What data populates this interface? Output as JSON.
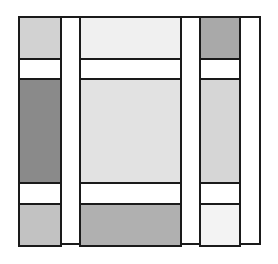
{
  "diagram": {
    "title": "",
    "frame": {
      "x": 18,
      "y": 16,
      "w": 241,
      "h": 229,
      "border": "#1a1a1a"
    },
    "columns_x": [
      18,
      60,
      79,
      180,
      199,
      239,
      259
    ],
    "rows_y": [
      16,
      58,
      78,
      182,
      203,
      245
    ],
    "cells": [
      {
        "id": "r1c1",
        "x": 18,
        "y": 16,
        "w": 42,
        "h": 42,
        "fill": "#d2d2d2"
      },
      {
        "id": "r1c3",
        "x": 79,
        "y": 16,
        "w": 101,
        "h": 42,
        "fill": "#f0f0f0"
      },
      {
        "id": "r1c5",
        "x": 199,
        "y": 16,
        "w": 40,
        "h": 42,
        "fill": "#a9a9a9"
      },
      {
        "id": "r2c1",
        "x": 18,
        "y": 58,
        "w": 42,
        "h": 20,
        "fill": "#ffffff"
      },
      {
        "id": "r2c3",
        "x": 79,
        "y": 58,
        "w": 101,
        "h": 20,
        "fill": "#ffffff"
      },
      {
        "id": "r2c5",
        "x": 199,
        "y": 58,
        "w": 40,
        "h": 20,
        "fill": "#ffffff"
      },
      {
        "id": "r3c1",
        "x": 18,
        "y": 78,
        "w": 42,
        "h": 104,
        "fill": "#8a8a8a"
      },
      {
        "id": "r3c3",
        "x": 79,
        "y": 78,
        "w": 101,
        "h": 104,
        "fill": "#e2e2e2"
      },
      {
        "id": "r3c5",
        "x": 199,
        "y": 78,
        "w": 40,
        "h": 104,
        "fill": "#d6d6d6"
      },
      {
        "id": "r4c1",
        "x": 18,
        "y": 182,
        "w": 42,
        "h": 21,
        "fill": "#ffffff"
      },
      {
        "id": "r4c3",
        "x": 79,
        "y": 182,
        "w": 101,
        "h": 21,
        "fill": "#ffffff"
      },
      {
        "id": "r4c5",
        "x": 199,
        "y": 182,
        "w": 40,
        "h": 21,
        "fill": "#ffffff"
      },
      {
        "id": "r5c1",
        "x": 18,
        "y": 203,
        "w": 42,
        "h": 42,
        "fill": "#c2c2c2"
      },
      {
        "id": "r5c3",
        "x": 79,
        "y": 203,
        "w": 101,
        "h": 42,
        "fill": "#b0b0b0"
      },
      {
        "id": "r5c5",
        "x": 199,
        "y": 203,
        "w": 40,
        "h": 42,
        "fill": "#f3f3f3"
      }
    ],
    "vertical_strips": [
      {
        "id": "strip-a",
        "x": 60,
        "y": 16,
        "w": 19,
        "h": 229,
        "fill": "#ffffff"
      },
      {
        "id": "strip-b",
        "x": 180,
        "y": 16,
        "w": 19,
        "h": 229,
        "fill": "#ffffff"
      },
      {
        "id": "strip-c",
        "x": 239,
        "y": 16,
        "w": 20,
        "h": 229,
        "fill": "#ffffff"
      }
    ]
  }
}
